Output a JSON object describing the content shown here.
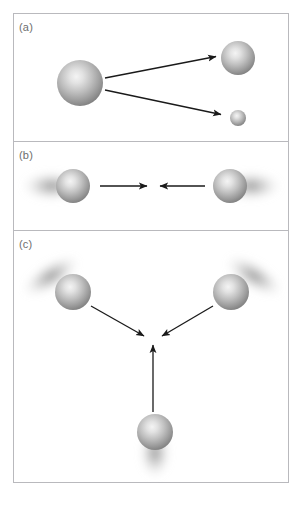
{
  "figure": {
    "background_color": "#ffffff",
    "border_color": "#b9b9bd",
    "arrow_color": "#1a1a1a",
    "sphere_highlight_color": "#f2f2f2",
    "sphere_mid_color": "#b0b0b0",
    "sphere_edge_color": "#7d7d7d",
    "halo_color": "#9a9a9a",
    "frame": {
      "x": 13,
      "y": 13,
      "width": 276,
      "height": 470
    },
    "dividers": [
      141,
      230
    ]
  },
  "panels": [
    {
      "id": "panel-a",
      "label": "(a)",
      "label_position": {
        "x": 19,
        "y": 22
      },
      "region": {
        "x": 13,
        "y": 13,
        "width": 276,
        "height": 128
      },
      "spheres": [
        {
          "name": "large-sphere-left",
          "cx": 80,
          "cy": 83,
          "r": 23,
          "halo": false
        },
        {
          "name": "medium-sphere-upper-right",
          "cx": 238,
          "cy": 58,
          "r": 17,
          "halo": false
        },
        {
          "name": "small-sphere-lower-right",
          "cx": 238,
          "cy": 118,
          "r": 8,
          "halo": false
        }
      ],
      "arrows": [
        {
          "name": "arrow-to-medium-sphere",
          "x1": 105,
          "y1": 78,
          "x2": 218,
          "y2": 57
        },
        {
          "name": "arrow-to-small-sphere",
          "x1": 105,
          "y1": 90,
          "x2": 223,
          "y2": 115
        }
      ]
    },
    {
      "id": "panel-b",
      "label": "(b)",
      "label_position": {
        "x": 19,
        "y": 150
      },
      "region": {
        "x": 13,
        "y": 141,
        "width": 276,
        "height": 89
      },
      "spheres": [
        {
          "name": "sphere-left",
          "cx": 73,
          "cy": 186,
          "r": 17,
          "halo": true,
          "halo_angle": 180
        },
        {
          "name": "sphere-right",
          "cx": 230,
          "cy": 186,
          "r": 17,
          "halo": true,
          "halo_angle": 0
        }
      ],
      "arrows": [
        {
          "name": "arrow-left-to-center",
          "x1": 100,
          "y1": 186,
          "x2": 149,
          "y2": 186
        },
        {
          "name": "arrow-right-to-center",
          "x1": 205,
          "y1": 186,
          "x2": 158,
          "y2": 186
        }
      ]
    },
    {
      "id": "panel-c",
      "label": "(c)",
      "label_position": {
        "x": 19,
        "y": 239
      },
      "region": {
        "x": 13,
        "y": 230,
        "width": 276,
        "height": 253
      },
      "spheres": [
        {
          "name": "sphere-upper-left",
          "cx": 73,
          "cy": 292,
          "r": 18,
          "halo": true,
          "halo_angle": 215
        },
        {
          "name": "sphere-upper-right",
          "cx": 231,
          "cy": 292,
          "r": 18,
          "halo": true,
          "halo_angle": 325
        },
        {
          "name": "sphere-bottom",
          "cx": 155,
          "cy": 432,
          "r": 18,
          "halo": true,
          "halo_angle": 90
        }
      ],
      "arrows": [
        {
          "name": "arrow-upper-left-to-center",
          "x1": 91,
          "y1": 307,
          "x2": 146,
          "y2": 338
        },
        {
          "name": "arrow-upper-right-to-center",
          "x1": 213,
          "y1": 307,
          "x2": 160,
          "y2": 338
        },
        {
          "name": "arrow-bottom-to-center",
          "x1": 153,
          "y1": 412,
          "x2": 153,
          "y2": 344
        }
      ],
      "convergence_point": {
        "x": 153,
        "y": 340
      }
    }
  ]
}
